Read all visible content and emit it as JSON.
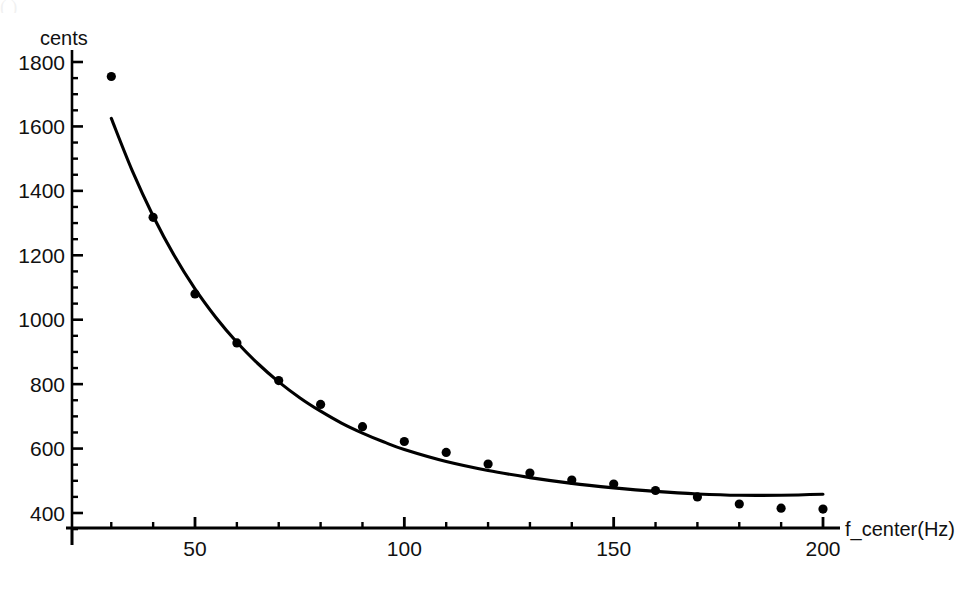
{
  "figure": {
    "ghost_caption": "( )                                                                                         ",
    "background_color": "#ffffff",
    "ink_color": "#000000"
  },
  "chart_data": {
    "type": "scatter",
    "title": "",
    "subtitle": "",
    "xlabel": "f_center(Hz)",
    "ylabel": "cents",
    "xlim": [
      20,
      210
    ],
    "ylim": [
      330,
      1800
    ],
    "grid": false,
    "legend": null,
    "x_ticks_major": [
      50,
      100,
      150,
      200
    ],
    "x_tick_labels": [
      "50",
      "100",
      "150",
      "200"
    ],
    "x_ticks_minor_step": 10,
    "y_ticks_major": [
      400,
      600,
      800,
      1000,
      1200,
      1400,
      1600,
      1800
    ],
    "y_tick_labels": [
      "400",
      "600",
      "800",
      "1000",
      "1200",
      "1400",
      "1600",
      "1800"
    ],
    "y_ticks_minor_step": 50,
    "series": [
      {
        "name": "measured",
        "kind": "scatter",
        "marker": "filled-circle",
        "marker_color": "#000000",
        "x": [
          30,
          40,
          50,
          60,
          70,
          80,
          90,
          100,
          110,
          120,
          130,
          140,
          150,
          160,
          170,
          180,
          190,
          200
        ],
        "y": [
          1755,
          1318,
          1080,
          928,
          811,
          737,
          668,
          622,
          588,
          552,
          524,
          502,
          490,
          470,
          450,
          428,
          415,
          412
        ]
      },
      {
        "name": "fit",
        "kind": "line",
        "line_color": "#000000",
        "x": [
          30,
          35,
          40,
          45,
          50,
          55,
          60,
          65,
          70,
          75,
          80,
          85,
          90,
          95,
          100,
          110,
          120,
          130,
          140,
          150,
          160,
          170,
          180,
          190,
          200
        ],
        "y": [
          1625,
          1463,
          1322,
          1200,
          1096,
          1007,
          930,
          864,
          807,
          758,
          716,
          679,
          648,
          621,
          597,
          560,
          532,
          510,
          492,
          478,
          467,
          459,
          455,
          455,
          458
        ]
      }
    ]
  }
}
